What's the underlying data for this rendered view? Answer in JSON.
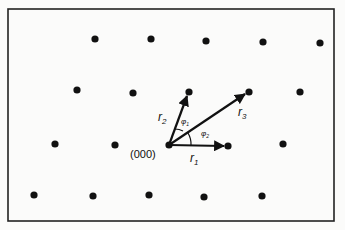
{
  "diagram": {
    "title": "",
    "origin_label": "(000)",
    "vectors": [
      {
        "label": "r",
        "sub": "1"
      },
      {
        "label": "r",
        "sub": "2"
      },
      {
        "label": "r",
        "sub": "3"
      }
    ],
    "angles": [
      {
        "label": "φ",
        "sub": "1"
      },
      {
        "label": "φ",
        "sub": "2"
      }
    ],
    "lattice_rows": 4,
    "points_per_row": 5
  }
}
